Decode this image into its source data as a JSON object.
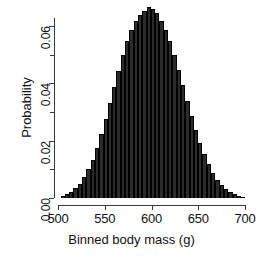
{
  "chart_data": {
    "type": "bar",
    "title": "",
    "subtitle": "",
    "xlabel": "Binned body mass (g)",
    "ylabel": "Probability",
    "xlim": [
      500,
      700
    ],
    "ylim": [
      0,
      0.068
    ],
    "grid": false,
    "legend": null,
    "x_ticks": [
      "500",
      "550",
      "600",
      "650",
      "700"
    ],
    "x_tick_values": [
      500,
      550,
      600,
      650,
      700
    ],
    "y_ticks": [
      "0.00",
      "0.02",
      "0.04",
      "0.06"
    ],
    "y_tick_values": [
      0.0,
      0.02,
      0.04,
      0.06
    ],
    "y_minor_tick_values": [
      0.01,
      0.03,
      0.05
    ],
    "bar_color": "#2b2b2b",
    "bar_edge_color": "#000000",
    "bin_width": 4.6,
    "categories": [
      505.0,
      509.6,
      514.2,
      518.8,
      523.4,
      528.0,
      532.6,
      537.2,
      541.8,
      546.4,
      551.0,
      555.6,
      560.2,
      564.8,
      569.4,
      574.0,
      578.6,
      583.2,
      587.8,
      592.4,
      597.0,
      601.6,
      606.2,
      610.8,
      615.4,
      620.0,
      624.6,
      629.2,
      633.8,
      638.4,
      643.0,
      647.6,
      652.2,
      656.8,
      661.4,
      666.0,
      670.6,
      675.2,
      679.8,
      684.4,
      689.0,
      693.6,
      698.2
    ],
    "values": [
      0.0008,
      0.0014,
      0.0022,
      0.0034,
      0.005,
      0.0072,
      0.01,
      0.0134,
      0.0175,
      0.0222,
      0.0274,
      0.033,
      0.0387,
      0.0444,
      0.0498,
      0.0546,
      0.0586,
      0.0616,
      0.0637,
      0.0652,
      0.0667,
      0.066,
      0.0644,
      0.0619,
      0.0586,
      0.0546,
      0.0499,
      0.0448,
      0.0394,
      0.034,
      0.0287,
      0.0237,
      0.0192,
      0.0152,
      0.0117,
      0.0088,
      0.0064,
      0.0046,
      0.0032,
      0.0021,
      0.0014,
      0.0008,
      0.0005
    ]
  },
  "axis": {
    "x_title": "Binned body mass (g)",
    "y_title": "Probability"
  }
}
